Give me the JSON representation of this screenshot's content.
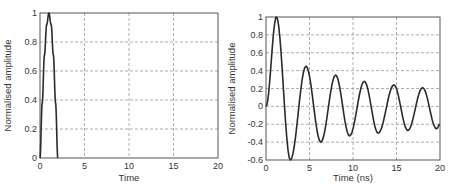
{
  "chart_data": [
    {
      "type": "line",
      "title": "",
      "xlabel": "Time",
      "ylabel": "Normalised amplitude",
      "xlim": [
        0,
        20
      ],
      "ylim": [
        0,
        1
      ],
      "xticks": [
        0,
        5,
        10,
        15,
        20
      ],
      "yticks": [
        0,
        0.2,
        0.4,
        0.6,
        0.8,
        1
      ],
      "ytick_labels": [
        "0",
        "0.2",
        "0.4",
        "0.6",
        "0.8",
        "1"
      ],
      "grid": true,
      "legend": null,
      "series": [
        {
          "name": "half-sine pulse",
          "x": [
            0,
            0.25,
            0.5,
            0.75,
            1.0,
            1.25,
            1.5,
            1.75,
            2.0
          ],
          "y": [
            0,
            0.38,
            0.71,
            0.92,
            1.0,
            0.92,
            0.71,
            0.38,
            0
          ]
        }
      ]
    },
    {
      "type": "line",
      "title": "",
      "xlabel": "Time (ns)",
      "ylabel": "Normalised amplitude",
      "xlim": [
        0,
        20
      ],
      "ylim": [
        -0.6,
        1
      ],
      "xticks": [
        0,
        5,
        10,
        15,
        20
      ],
      "yticks": [
        -0.6,
        -0.4,
        -0.2,
        0,
        0.2,
        0.4,
        0.6,
        0.8,
        1
      ],
      "ytick_labels": [
        "-0.6",
        "-0.4",
        "-0.2",
        "0",
        "0.2",
        "0.4",
        "0.6",
        "0.8",
        "1"
      ],
      "grid": true,
      "legend": null,
      "series": [
        {
          "name": "damped oscillation",
          "x": [
            0,
            1.2,
            2.8,
            4.6,
            6.3,
            8.0,
            9.6,
            11.3,
            12.9,
            14.7,
            16.3,
            18.0,
            19.6,
            20
          ],
          "y": [
            0,
            1.0,
            -0.6,
            0.45,
            -0.4,
            0.35,
            -0.33,
            0.28,
            -0.3,
            0.24,
            -0.27,
            0.21,
            -0.25,
            -0.2
          ]
        }
      ]
    }
  ]
}
